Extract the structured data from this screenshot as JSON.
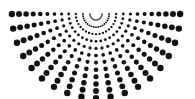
{
  "figure": {
    "width": 195,
    "height": 99,
    "background_color": "#ffffff",
    "dot_color": "#111111"
  },
  "chart_data": {
    "type": "scatter",
    "xlabel": "",
    "ylabel": "",
    "xlim": [
      0,
      195
    ],
    "ylim": [
      0,
      99
    ],
    "grid": false,
    "legend": "none",
    "marker": "circle",
    "color": "#111111",
    "polar_origin": {
      "x": 96,
      "y": 14
    },
    "ray_count": 19,
    "ring_count": 12,
    "angle_start_deg": 0,
    "angle_end_deg": 180,
    "radius_start": 6,
    "radius_step": 7.1,
    "dot_size_min": 0.7,
    "dot_size_max": 3.2
  }
}
